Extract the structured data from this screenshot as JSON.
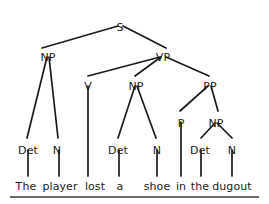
{
  "figure": {
    "type": "constituency-parse-tree",
    "sentence": "The player lost a shoe in the dugout",
    "ink_color": "#1b1b1b",
    "background_color": "#ffffff",
    "baseline_rule": {
      "x1": 10,
      "x2": 259,
      "y": 197,
      "color": "#3a3a3a"
    }
  },
  "nodes": [
    {
      "id": "S",
      "label": "S",
      "x": 120,
      "y": 22
    },
    {
      "id": "NP1",
      "label": "NP",
      "x": 48,
      "y": 52
    },
    {
      "id": "VP",
      "label": "VP",
      "x": 163,
      "y": 52
    },
    {
      "id": "V",
      "label": "V",
      "x": 88,
      "y": 81
    },
    {
      "id": "NP2",
      "label": "NP",
      "x": 136,
      "y": 81
    },
    {
      "id": "PP",
      "label": "PP",
      "x": 210,
      "y": 81
    },
    {
      "id": "P",
      "label": "P",
      "x": 181,
      "y": 118
    },
    {
      "id": "NP3",
      "label": "NP",
      "x": 216,
      "y": 118
    },
    {
      "id": "Det1",
      "label": "Det",
      "x": 28,
      "y": 145
    },
    {
      "id": "N1",
      "label": "N",
      "x": 57,
      "y": 145
    },
    {
      "id": "Det2",
      "label": "Det",
      "x": 118,
      "y": 145
    },
    {
      "id": "N2",
      "label": "N",
      "x": 157,
      "y": 145
    },
    {
      "id": "Det3",
      "label": "Det",
      "x": 200,
      "y": 145
    },
    {
      "id": "N3",
      "label": "N",
      "x": 232,
      "y": 145
    }
  ],
  "terminals": [
    {
      "id": "w1",
      "label": "The",
      "x": 26,
      "y": 181,
      "parent": "Det1"
    },
    {
      "id": "w2",
      "label": "player",
      "x": 60,
      "y": 181,
      "parent": "N1"
    },
    {
      "id": "w3",
      "label": "lost",
      "x": 95,
      "y": 181,
      "parent": "V"
    },
    {
      "id": "w4",
      "label": "a",
      "x": 120,
      "y": 181,
      "parent": "Det2"
    },
    {
      "id": "w5",
      "label": "shoe",
      "x": 157,
      "y": 181,
      "parent": "N2"
    },
    {
      "id": "w6",
      "label": "in",
      "x": 181,
      "y": 181,
      "parent": "P"
    },
    {
      "id": "w7",
      "label": "the",
      "x": 200,
      "y": 181,
      "parent": "Det3"
    },
    {
      "id": "w8",
      "label": "dugout",
      "x": 232,
      "y": 181,
      "parent": "N3"
    }
  ],
  "edges": [
    {
      "from": "S",
      "to": "NP1",
      "x1": 118,
      "y1": 26,
      "x2": 42,
      "y2": 48
    },
    {
      "from": "S",
      "to": "VP",
      "x1": 123,
      "y1": 26,
      "x2": 166,
      "y2": 48
    },
    {
      "from": "NP1",
      "to": "Det1",
      "x1": 47,
      "y1": 57,
      "x2": 27,
      "y2": 138
    },
    {
      "from": "NP1",
      "to": "N1",
      "x1": 49,
      "y1": 57,
      "x2": 58,
      "y2": 138
    },
    {
      "from": "VP",
      "to": "V",
      "x1": 160,
      "y1": 57,
      "x2": 88,
      "y2": 76
    },
    {
      "from": "VP",
      "to": "NP2",
      "x1": 161,
      "y1": 57,
      "x2": 135,
      "y2": 76
    },
    {
      "from": "VP",
      "to": "PP",
      "x1": 166,
      "y1": 57,
      "x2": 209,
      "y2": 76
    },
    {
      "from": "V",
      "to": "w3",
      "x1": 88,
      "y1": 86,
      "x2": 88,
      "y2": 176
    },
    {
      "from": "NP2",
      "to": "Det2",
      "x1": 135,
      "y1": 86,
      "x2": 118,
      "y2": 138
    },
    {
      "from": "NP2",
      "to": "N2",
      "x1": 137,
      "y1": 86,
      "x2": 156,
      "y2": 138
    },
    {
      "from": "PP",
      "to": "P",
      "x1": 208,
      "y1": 86,
      "x2": 180,
      "y2": 111
    },
    {
      "from": "PP",
      "to": "NP3",
      "x1": 211,
      "y1": 86,
      "x2": 218,
      "y2": 111
    },
    {
      "from": "P",
      "to": "w6",
      "x1": 181,
      "y1": 122,
      "x2": 181,
      "y2": 176
    },
    {
      "from": "NP3",
      "to": "Det3",
      "x1": 215,
      "y1": 123,
      "x2": 201,
      "y2": 138
    },
    {
      "from": "NP3",
      "to": "N3",
      "x1": 217,
      "y1": 123,
      "x2": 232,
      "y2": 138
    },
    {
      "from": "Det1",
      "to": "w1",
      "x1": 28,
      "y1": 150,
      "x2": 28,
      "y2": 176
    },
    {
      "from": "N1",
      "to": "w2",
      "x1": 59,
      "y1": 150,
      "x2": 59,
      "y2": 176
    },
    {
      "from": "Det2",
      "to": "w4",
      "x1": 119,
      "y1": 150,
      "x2": 119,
      "y2": 176
    },
    {
      "from": "N2",
      "to": "w5",
      "x1": 157,
      "y1": 150,
      "x2": 157,
      "y2": 176
    },
    {
      "from": "Det3",
      "to": "w7",
      "x1": 201,
      "y1": 150,
      "x2": 201,
      "y2": 176
    },
    {
      "from": "N3",
      "to": "w8",
      "x1": 232,
      "y1": 150,
      "x2": 232,
      "y2": 176
    }
  ]
}
